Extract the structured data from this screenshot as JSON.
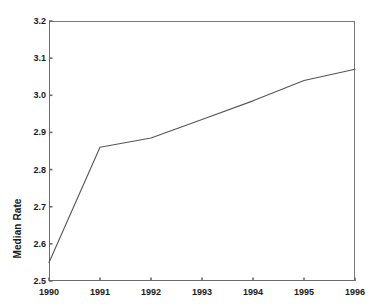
{
  "chart_data": {
    "type": "line",
    "title": "",
    "xlabel": "",
    "ylabel": "Median Rate",
    "x": [
      1990,
      1991,
      1992,
      1993,
      1994,
      1995,
      1996
    ],
    "values": [
      2.55,
      2.86,
      2.885,
      2.935,
      2.985,
      3.04,
      3.07
    ],
    "series": [
      {
        "name": "Median Rate",
        "values": [
          2.55,
          2.86,
          2.885,
          2.935,
          2.985,
          3.04,
          3.07
        ]
      }
    ],
    "xlim": [
      1990,
      1996
    ],
    "ylim": [
      2.5,
      3.2
    ],
    "x_tick_labels": [
      "1990",
      "1991",
      "1992",
      "1993",
      "1994",
      "1995",
      "1996"
    ],
    "y_tick_labels": [
      "2.5",
      "2.6",
      "2.7",
      "2.8",
      "2.9",
      "3.0",
      "3.1",
      "3.2"
    ],
    "y_ticks": [
      2.5,
      2.6,
      2.7,
      2.8,
      2.9,
      3.0,
      3.1,
      3.2
    ],
    "grid": false,
    "legend": "none",
    "line_color": "#555555",
    "axis_color": "#6b6b6b",
    "background_color": "#ffffff"
  }
}
